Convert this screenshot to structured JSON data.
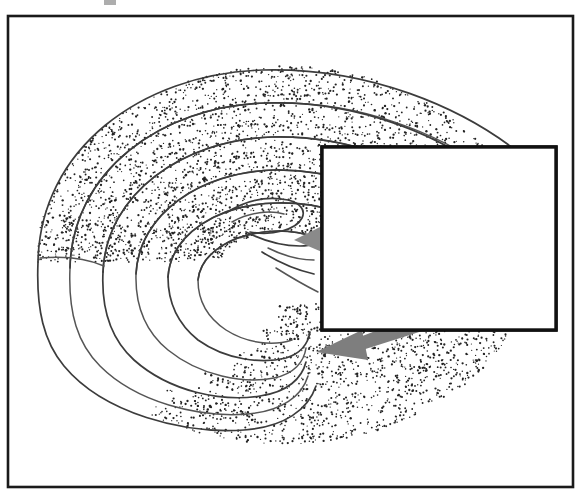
{
  "figure": {
    "kind": "scientific-diagram",
    "title": "",
    "description": "Stippled three-dimensional spiral scroll (chaotic attractor funnel) with a rectangular inset box containing a tangled toroidal trajectory, joined by thick gray arrows",
    "background_color": "#ffffff",
    "frame": {
      "name": "outer-frame",
      "x": 8,
      "y": 16,
      "width": 565,
      "height": 471,
      "stroke_color": "#1a1a1a",
      "stroke_width": 2.6,
      "fill": "none"
    },
    "top_artifact": {
      "x": 104,
      "y": 0,
      "width": 12,
      "height": 5,
      "color": "#4a4a4a"
    }
  },
  "scroll": {
    "name": "stippled-spiral-scroll",
    "stipple_color": "#222222",
    "outline_color": "#555555",
    "dot_count": 7400,
    "dot_radius": 0.85,
    "bands": [
      {
        "label": "outer-band",
        "turn": 1
      },
      {
        "label": "second-band",
        "turn": 2
      },
      {
        "label": "third-band",
        "turn": 3
      },
      {
        "label": "inner-band",
        "turn": 4
      },
      {
        "label": "core-band",
        "turn": 5
      },
      {
        "label": "lower-outer-band",
        "turn": 6
      }
    ],
    "center": {
      "x": 300,
      "y": 240
    },
    "extent": {
      "x": 20,
      "y": 60,
      "width": 350,
      "height": 370
    }
  },
  "inset": {
    "name": "inset-detail-box",
    "x": 322,
    "y": 147,
    "width": 234,
    "height": 183,
    "stroke_color": "#111111",
    "stroke_width": 3.4,
    "fill_color": "#ffffff",
    "content_label": "toroidal trajectory loops",
    "trajectory_color": "#6b6b6b",
    "loop_count": 9,
    "node_markers": [
      {
        "x": 355,
        "y": 160
      },
      {
        "x": 387,
        "y": 232
      },
      {
        "x": 500,
        "y": 232
      },
      {
        "x": 357,
        "y": 282
      }
    ]
  },
  "arrows": [
    {
      "name": "arrow-to-scroll-upper",
      "color": "#8a8a8a",
      "from": {
        "x": 390,
        "y": 230
      },
      "to": {
        "x": 300,
        "y": 238
      },
      "direction": "left"
    },
    {
      "name": "arrow-to-scroll-mid",
      "color": "#8a8a8a",
      "from": {
        "x": 392,
        "y": 272
      },
      "to": {
        "x": 333,
        "y": 293
      },
      "direction": "left-down"
    },
    {
      "name": "arrow-to-scroll-lower",
      "color": "#7e7e7e",
      "from": {
        "x": 470,
        "y": 300
      },
      "to": {
        "x": 318,
        "y": 352
      },
      "direction": "left-down"
    }
  ],
  "stipple_trails": {
    "name": "dotted-trajectory-trail",
    "color": "#2a2a2a",
    "dot_count": 210,
    "region": {
      "x": 330,
      "y": 150,
      "width": 225,
      "height": 120
    }
  },
  "palette": {
    "frame": "#1a1a1a",
    "inset_border": "#111111",
    "trajectory": "#6b6b6b",
    "arrow": "#8a8a8a",
    "stipple": "#222222",
    "outline": "#555555",
    "background": "#ffffff"
  }
}
